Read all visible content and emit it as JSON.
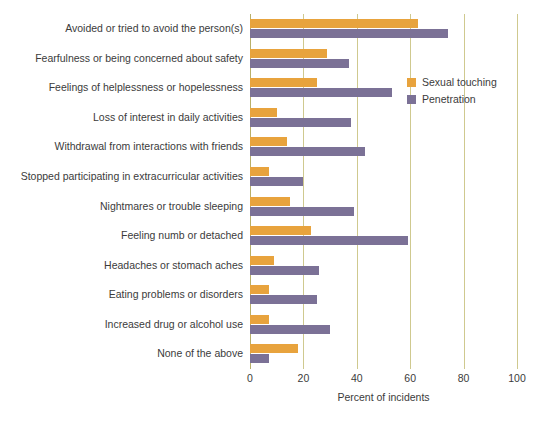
{
  "chart_data": {
    "type": "bar",
    "orientation": "horizontal",
    "title": "",
    "xlabel": "Percent of incidents",
    "ylabel": "",
    "xlim": [
      0,
      100
    ],
    "xticks": [
      0,
      20,
      40,
      60,
      80,
      100
    ],
    "xtick_labels": [
      "0",
      "20",
      "40",
      "60",
      "80",
      "100"
    ],
    "grid": true,
    "legend_position": "upper right",
    "categories": [
      "Avoided or tried to avoid the person(s)",
      "Fearfulness or being concerned about safety",
      "Feelings of helplessness or hopelessness",
      "Loss of interest in daily activities",
      "Withdrawal from interactions with friends",
      "Stopped participating in extracurricular activities",
      "Nightmares or trouble sleeping",
      "Feeling numb or detached",
      "Headaches or stomach aches",
      "Eating problems or disorders",
      "Increased drug or alcohol use",
      "None of the above"
    ],
    "series": [
      {
        "name": "Sexual touching",
        "color": "#e8a33d",
        "values": [
          63,
          29,
          25,
          10,
          14,
          7,
          15,
          23,
          9,
          7,
          7,
          18
        ]
      },
      {
        "name": "Penetration",
        "color": "#7b7196",
        "values": [
          74,
          37,
          53,
          38,
          43,
          20,
          39,
          59,
          26,
          25,
          30,
          7
        ]
      }
    ],
    "colors": {
      "gridline": "#cfc98f",
      "axis": "#b8b06a",
      "text": "#3b3b3b",
      "background": "#ffffff"
    }
  }
}
